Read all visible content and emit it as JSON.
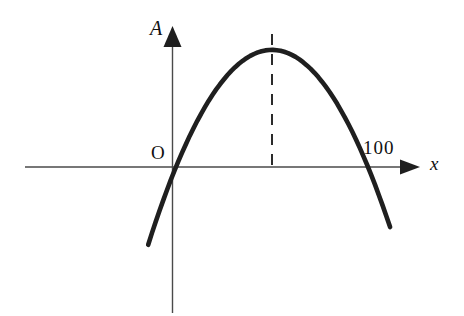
{
  "figure": {
    "background": "#ffffff",
    "curve_color": "#1f1f1f",
    "axis_color": "#4a4a4a",
    "dash_color": "#2b2b2b",
    "text_color": "#111111",
    "y_axis_label": "A",
    "x_axis_label": "x",
    "origin_label": "O"
  },
  "chart_data": {
    "type": "line",
    "title": "",
    "xlabel": "x",
    "ylabel": "A",
    "roots": [
      0,
      100
    ],
    "vertex": {
      "x": 50,
      "A": 61
    },
    "guide_x": 50,
    "x_draw_range": [
      -14.5,
      111.5
    ],
    "x_ticks": [
      {
        "value": 100,
        "label": "100"
      }
    ],
    "axes": {
      "x_range": [
        -79,
        127
      ],
      "A_range": [
        -76,
        73
      ],
      "origin_label": "O",
      "arrows": [
        "up",
        "right"
      ]
    },
    "grid": false,
    "legend": null
  }
}
